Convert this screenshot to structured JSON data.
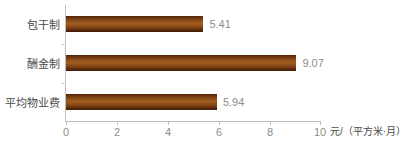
{
  "chart_data": {
    "type": "bar",
    "orientation": "horizontal",
    "title": "",
    "categories": [
      "包干制",
      "酬金制",
      "平均物业费"
    ],
    "values": [
      5.41,
      9.07,
      5.94
    ],
    "value_labels": [
      "5.41",
      "9.07",
      "5.94"
    ],
    "xlabel": "元/（平方米·月）",
    "ylabel": "",
    "xlim": [
      0,
      10
    ],
    "xticks": [
      0,
      2,
      4,
      6,
      8,
      10
    ],
    "xtick_labels": [
      "0",
      "2",
      "4",
      "6",
      "8",
      "10"
    ],
    "grid": false,
    "legend": false,
    "bar_color": "#8a4a18"
  },
  "axis": {
    "unit_label": "元/（平方米·月）"
  },
  "caption": {
    "text": ""
  },
  "colors": {
    "bar_dark": "#3d1c06",
    "bar_mid": "#a25d1f",
    "axis": "#bdbdbd",
    "tick_text": "#8c8c8c",
    "category_text": "#4a4a4a"
  }
}
